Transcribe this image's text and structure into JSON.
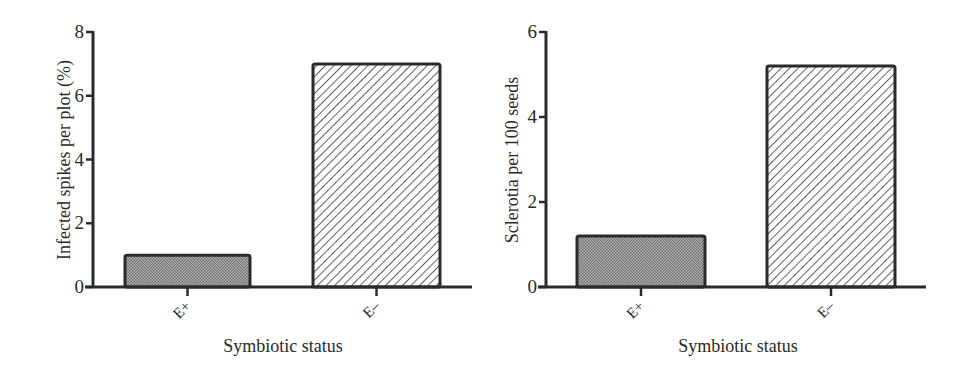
{
  "chart_data": [
    {
      "type": "bar",
      "title": "",
      "xlabel": "Symbiotic status",
      "ylabel": "Infected spikes per plot (%)",
      "categories": [
        "E+",
        "E–"
      ],
      "values": [
        1.0,
        7.0
      ],
      "ylim": [
        0,
        8
      ],
      "yticks": [
        0,
        2,
        4,
        6,
        8
      ],
      "grid": false,
      "legend": null,
      "bar_fills": [
        "stippled-gray",
        "diagonal-hatch"
      ]
    },
    {
      "type": "bar",
      "title": "",
      "xlabel": "Symbiotic status",
      "ylabel": "Sclerotia per 100 seeds",
      "categories": [
        "E+",
        "E–"
      ],
      "values": [
        1.2,
        5.2
      ],
      "ylim": [
        0,
        6
      ],
      "yticks": [
        0,
        2,
        4,
        6
      ],
      "grid": false,
      "legend": null,
      "bar_fills": [
        "stippled-gray",
        "diagonal-hatch"
      ]
    }
  ],
  "colors": {
    "axis": "#2a2a2a",
    "stipple_bar": "#9a9a9a",
    "hatch_line": "#3a3a3a",
    "background": "#ffffff"
  }
}
